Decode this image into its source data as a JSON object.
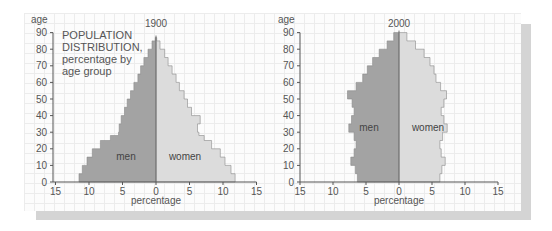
{
  "annotation": {
    "line1": "POPULATION",
    "line2": "DISTRIBUTION,",
    "line3": "percentage by",
    "line4": "age group"
  },
  "colors": {
    "men": "#a3a3a3",
    "women": "#dcdcdc",
    "center_line": "#6f6f6f",
    "axis": "#555555",
    "text": "#555555",
    "label_text": "#444444"
  },
  "chart_data": [
    {
      "type": "bar",
      "subtype": "population-pyramid",
      "title": "1900",
      "xlabel": "percentage",
      "ylabel": "age",
      "x_ticks": [
        "15",
        "10",
        "5",
        "0",
        "5",
        "10",
        "15"
      ],
      "y_ticks": [
        "0",
        "10",
        "20",
        "30",
        "40",
        "50",
        "60",
        "70",
        "80",
        "90"
      ],
      "xlim": [
        -15,
        15
      ],
      "ylim": [
        0,
        90
      ],
      "grid": true,
      "series_labels": {
        "men": "men",
        "women": "women"
      },
      "ages": [
        0,
        5,
        10,
        15,
        20,
        25,
        28,
        30,
        35,
        40,
        45,
        50,
        55,
        60,
        65,
        70,
        75,
        80,
        85,
        87
      ],
      "series": [
        {
          "name": "men",
          "values": [
            11.5,
            11.0,
            10.3,
            9.5,
            8.3,
            6.8,
            5.6,
            5.5,
            5.2,
            4.7,
            4.3,
            3.8,
            3.3,
            2.7,
            2.3,
            1.8,
            1.2,
            0.6,
            0.1,
            0.0
          ]
        },
        {
          "name": "women",
          "values": [
            11.8,
            11.2,
            10.3,
            9.6,
            8.3,
            7.2,
            6.4,
            6.2,
            6.6,
            5.3,
            4.7,
            4.2,
            3.5,
            3.0,
            2.4,
            1.8,
            1.3,
            0.6,
            0.1,
            0.0
          ]
        }
      ]
    },
    {
      "type": "bar",
      "subtype": "population-pyramid",
      "title": "2000",
      "xlabel": "percentage",
      "ylabel": "age",
      "x_ticks": [
        "15",
        "10",
        "5",
        "0",
        "5",
        "10",
        "15"
      ],
      "y_ticks": [
        "0",
        "10",
        "20",
        "30",
        "40",
        "50",
        "60",
        "70",
        "80",
        "90"
      ],
      "xlim": [
        -15,
        15
      ],
      "ylim": [
        0,
        90
      ],
      "grid": true,
      "series_labels": {
        "men": "men",
        "women": "women"
      },
      "ages": [
        0,
        5,
        10,
        15,
        20,
        25,
        30,
        35,
        40,
        45,
        50,
        55,
        60,
        65,
        70,
        75,
        80,
        85,
        90
      ],
      "series": [
        {
          "name": "men",
          "values": [
            6.3,
            6.6,
            7.3,
            6.8,
            6.5,
            6.8,
            7.6,
            7.2,
            6.8,
            7.1,
            7.8,
            6.5,
            5.5,
            4.8,
            4.0,
            3.0,
            1.8,
            0.8,
            0.2
          ]
        },
        {
          "name": "women",
          "values": [
            6.2,
            6.5,
            7.0,
            6.4,
            6.2,
            6.6,
            7.3,
            6.8,
            6.4,
            6.8,
            7.2,
            6.3,
            5.6,
            5.3,
            4.7,
            3.8,
            2.5,
            1.2,
            0.3
          ]
        }
      ]
    }
  ]
}
